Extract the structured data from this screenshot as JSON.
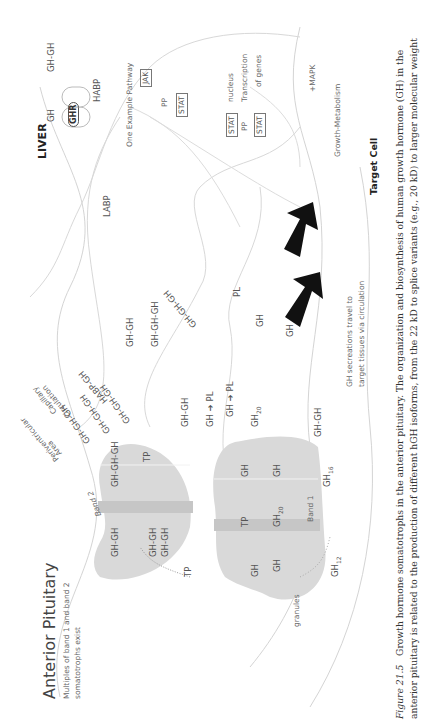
{
  "figure": {
    "anterior_pituitary": {
      "title": "Anterior Pituitary",
      "subtitle_line1": "Multiples of band 1 and band 2",
      "subtitle_line2": "somatotrophs exist"
    },
    "liver": {
      "title": "LIVER",
      "gh_label": "GH",
      "ghgh_label": "GH-GH",
      "receptor_label": "GHR",
      "pathway_title": "One Example Pathway",
      "jak": "JAK",
      "phospho": "PP",
      "stat": "STAT",
      "stat_dimer_top": "STAT",
      "stat_dimer_pp": "PP",
      "stat_dimer_bottom": "STAT",
      "nucleus": "nucleus",
      "transcription_line1": "Transcription",
      "transcription_line2": "of genes",
      "mapk": "MAPK",
      "growth_metabolism": "Growth-Metabolism",
      "plus": "+"
    },
    "target_cell": "Target Cell",
    "circulation": {
      "capillary_line1": "Capillary",
      "capillary_line2": "Circulation",
      "periventricular_line1": "Periventricular",
      "periventricular_line2": "Area",
      "habp": "HABP",
      "labp": "LABP",
      "secretions_line1": "GH secreations travel to",
      "secretions_line2": "target tissues via circulation"
    },
    "molecules": {
      "habp_gh": "HABP-GH",
      "gh_gh_a": "GH-GH",
      "gh_gh_gh_a": "GH-GH-GH",
      "gh_gh_gh_b": "GH-GH-GH",
      "pl_a": "PL",
      "gh_a": "GH",
      "gh_b": "GH",
      "gh_gh_gh_c": "GH-GH-GH",
      "gh_gh_gh_d": "GH-GH-GH",
      "gh_gh_gh_e": "GH-GH-GH",
      "gh_gh_b": "GH-GH",
      "gh_to_pl_a_gh": "GH",
      "gh_to_pl_a_pl": "PL",
      "gh_to_pl_b_gh": "GH",
      "gh_to_pl_b_pl": "PL",
      "gh20": "GH",
      "gh20_sub": "20",
      "gh_gh_c": "GH-GH"
    },
    "band2": {
      "label": "Band 2",
      "gh_gh_gh": "GH-GH-GH",
      "tp_top": "TP",
      "gh_gh_a": "GH-GH",
      "gh_gh_b": "GH-GH",
      "gh_gh_c": "GH-GH",
      "tp_bottom": "TP"
    },
    "band1": {
      "label": "Band 1",
      "gh_a": "GH",
      "gh_b": "GH",
      "tp": "TP",
      "gh20": "GH",
      "gh20_sub": "20",
      "gh_c": "GH",
      "gh_d": "GH",
      "gh16": "GH",
      "gh16_sub": "16",
      "gh12": "GH",
      "gh12_sub": "12",
      "granules": "granules"
    },
    "caption": {
      "figure_label": "Figure 21.5",
      "line1": "Growth hormone somatotrophs in the anterior pituitary. The organization and biosynthesis of human growth hormone (GH) in the",
      "line2": "anterior pituitary is related to the production of different hGH isoforms, from the 22 kD to splice variants (e.g., 20 kD) to larger molecular weight"
    },
    "colors": {
      "band_fill": "#d9d9d9",
      "band_stripe": "#c4c4c4",
      "outline": "#d0d0d0",
      "arrow": "#111111"
    }
  }
}
